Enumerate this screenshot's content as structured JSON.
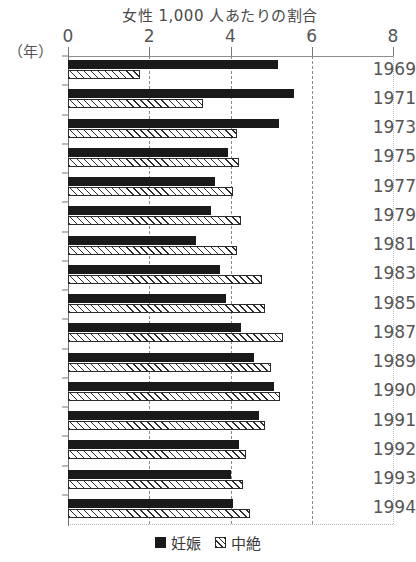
{
  "chart_data": {
    "type": "bar",
    "orientation": "horizontal",
    "title": "女性 1,000 人あたりの割合",
    "xlabel": "",
    "ylabel": "（年）",
    "xlim": [
      0,
      8
    ],
    "xticks": [
      0,
      2,
      4,
      6,
      8
    ],
    "xtick_labels": [
      "0",
      "2",
      "4",
      "6",
      "8"
    ],
    "grid": true,
    "legend_position": "bottom-center",
    "categories": [
      "1969",
      "1971",
      "1973",
      "1975",
      "1977",
      "1979",
      "1981",
      "1983",
      "1985",
      "1987",
      "1989",
      "1990",
      "1991",
      "1992",
      "1993",
      "1994"
    ],
    "series": [
      {
        "name": "妊娠",
        "style": "solid-black",
        "color": "#1a1a1a",
        "values": [
          5.16,
          5.56,
          5.2,
          3.95,
          3.63,
          3.53,
          3.16,
          3.73,
          3.88,
          4.25,
          4.57,
          5.06,
          4.7,
          4.2,
          4.02,
          4.07
        ]
      },
      {
        "name": "中絶",
        "style": "hatched",
        "color": "#ffffff",
        "values": [
          1.78,
          3.33,
          4.17,
          4.2,
          4.05,
          4.25,
          4.15,
          4.78,
          4.84,
          5.3,
          4.99,
          5.23,
          4.84,
          4.37,
          4.3,
          4.47
        ]
      }
    ],
    "legend": [
      "妊娠",
      "中絶"
    ]
  }
}
